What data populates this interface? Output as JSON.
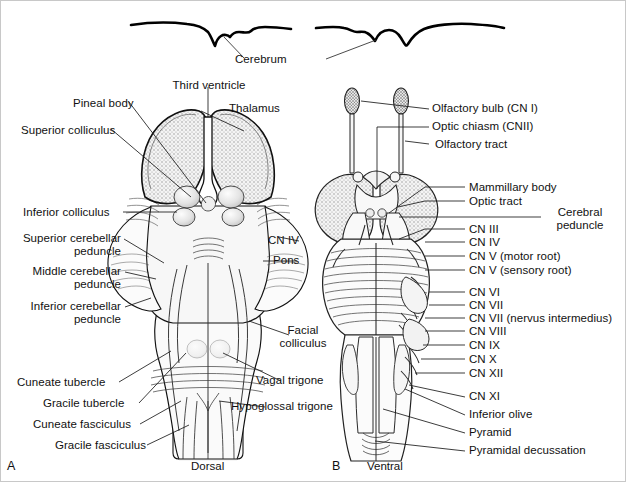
{
  "figure": {
    "background": "#ffffff",
    "ink": "#111111",
    "width": 626,
    "height": 482
  },
  "shared": {
    "cerebrum_label": "Cerebrum"
  },
  "panels": [
    {
      "id": "A",
      "letter": "A",
      "view_caption": "Dorsal",
      "labels": [
        {
          "name": "third-ventricle",
          "text": "Third ventricle",
          "x": 162,
          "y": 78,
          "align": "center"
        },
        {
          "name": "pineal-body",
          "text": "Pineal body",
          "x": 72,
          "y": 96,
          "align": "left"
        },
        {
          "name": "thalamus",
          "text": "Thalamus",
          "x": 204,
          "y": 101,
          "align": "left"
        },
        {
          "name": "superior-colliculus",
          "text": "Superior colliculus",
          "x": 20,
          "y": 123,
          "align": "left"
        },
        {
          "name": "inferior-colliculus",
          "text": "Inferior colliculus",
          "x": 22,
          "y": 206,
          "align": "left"
        },
        {
          "name": "superior-cerebellar-peduncle",
          "text": "Superior cerebellar\npeduncle",
          "x": 14,
          "y": 232,
          "align": "left"
        },
        {
          "name": "middle-cerebellar-peduncle",
          "text": "Middle cerebellar\npeduncle",
          "x": 17,
          "y": 265,
          "align": "left"
        },
        {
          "name": "inferior-cerebellar-peduncle",
          "text": "Inferior cerebellar\npeduncle",
          "x": 16,
          "y": 300,
          "align": "left"
        },
        {
          "name": "cuneate-tubercle",
          "text": "Cuneate tubercle",
          "x": 18,
          "y": 377,
          "align": "left"
        },
        {
          "name": "gracile-tubercle",
          "text": "Gracile tubercle",
          "x": 44,
          "y": 398,
          "align": "left"
        },
        {
          "name": "cuneate-fasciculus",
          "text": "Cuneate fasciculus",
          "x": 34,
          "y": 419,
          "align": "left"
        },
        {
          "name": "gracile-fasciculus",
          "text": "Gracile fasciculus",
          "x": 56,
          "y": 440,
          "align": "left"
        },
        {
          "name": "cn-iv",
          "text": "CN IV",
          "x": 267,
          "y": 237,
          "align": "left"
        },
        {
          "name": "pons",
          "text": "Pons",
          "x": 272,
          "y": 257,
          "align": "left"
        },
        {
          "name": "facial-colliculus",
          "text": "Facial\ncolliculus",
          "x": 272,
          "y": 327,
          "align": "left"
        },
        {
          "name": "vagal-trigone",
          "text": "Vagal trigone",
          "x": 255,
          "y": 377,
          "align": "left"
        },
        {
          "name": "hypoglossal-trigone",
          "text": "Hypoglossal trigone",
          "x": 232,
          "y": 402,
          "align": "left"
        }
      ]
    },
    {
      "id": "B",
      "letter": "B",
      "view_caption": "Ventral",
      "labels": [
        {
          "name": "olfactory-bulb",
          "text": "Olfactory bulb (CN I)",
          "x": 431,
          "y": 106,
          "align": "left"
        },
        {
          "name": "optic-chiasm",
          "text": "Optic chiasm (CNII)",
          "x": 431,
          "y": 122,
          "align": "left"
        },
        {
          "name": "olfactory-tract",
          "text": "Olfactory tract",
          "x": 431,
          "y": 139,
          "align": "left"
        },
        {
          "name": "mammillary-body",
          "text": "Mammillary body",
          "x": 468,
          "y": 182,
          "align": "left"
        },
        {
          "name": "optic-tract",
          "text": "Optic tract",
          "x": 468,
          "y": 197,
          "align": "left"
        },
        {
          "name": "cerebral-peduncle",
          "text": "Cerebral\npeduncle",
          "x": 543,
          "y": 207,
          "align": "left"
        },
        {
          "name": "cn-iii",
          "text": "CN III",
          "x": 468,
          "y": 224,
          "align": "left"
        },
        {
          "name": "cn-iv-b",
          "text": "CN IV",
          "x": 468,
          "y": 238,
          "align": "left"
        },
        {
          "name": "cn-v-motor",
          "text": "CN V (motor root)",
          "x": 468,
          "y": 252,
          "align": "left"
        },
        {
          "name": "cn-v-sensory",
          "text": "CN V (sensory root)",
          "x": 468,
          "y": 266,
          "align": "left"
        },
        {
          "name": "cn-vi",
          "text": "CN VI",
          "x": 468,
          "y": 288,
          "align": "left"
        },
        {
          "name": "cn-vii",
          "text": "CN VII",
          "x": 468,
          "y": 301,
          "align": "left"
        },
        {
          "name": "cn-vii-nervus-intermedius",
          "text": "CN VII (nervus intermedius)",
          "x": 468,
          "y": 314,
          "align": "left"
        },
        {
          "name": "cn-viii",
          "text": "CN VIII",
          "x": 468,
          "y": 327,
          "align": "left"
        },
        {
          "name": "cn-ix",
          "text": "CN IX",
          "x": 468,
          "y": 341,
          "align": "left"
        },
        {
          "name": "cn-x",
          "text": "CN X",
          "x": 468,
          "y": 355,
          "align": "left"
        },
        {
          "name": "cn-xii",
          "text": "CN XII",
          "x": 468,
          "y": 369,
          "align": "left"
        },
        {
          "name": "cn-xi",
          "text": "CN XI",
          "x": 468,
          "y": 392,
          "align": "left"
        },
        {
          "name": "inferior-olive",
          "text": "Inferior olive",
          "x": 468,
          "y": 410,
          "align": "left"
        },
        {
          "name": "pyramid",
          "text": "Pyramid",
          "x": 468,
          "y": 428,
          "align": "left"
        },
        {
          "name": "pyramidal-decussation",
          "text": "Pyramidal decussation",
          "x": 468,
          "y": 446,
          "align": "left"
        }
      ]
    }
  ],
  "captions": {
    "panel_a_letter": "A",
    "panel_a_view": "Dorsal",
    "panel_b_letter": "B",
    "panel_b_view": "Ventral"
  },
  "colors": {
    "outline": "#111111",
    "stipple_dark": "#6f6f6f",
    "stipple_mid": "#9a9a9a",
    "fill_light": "#f2f2f2",
    "fill_pale": "#fbfbfb",
    "leader": "#1a1a1a"
  }
}
